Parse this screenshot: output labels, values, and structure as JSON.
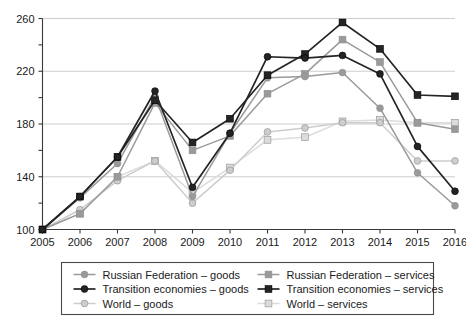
{
  "chart_data": {
    "type": "line",
    "title": "",
    "subtitle": "",
    "xlabel": "",
    "ylabel": "",
    "x": [
      2005,
      2006,
      2007,
      2008,
      2009,
      2010,
      2011,
      2012,
      2013,
      2014,
      2015,
      2016
    ],
    "categories": [
      "2005",
      "2006",
      "2007",
      "2008",
      "2009",
      "2010",
      "2011",
      "2012",
      "2013",
      "2014",
      "2015",
      "2016"
    ],
    "xlim": [
      2005,
      2016
    ],
    "ylim": [
      100,
      260
    ],
    "y_ticks_labeled": [
      100,
      140,
      180,
      220,
      260
    ],
    "y_ticks_minor": [
      120,
      160,
      200,
      240
    ],
    "grid": "horizontal",
    "legend_position": "bottom",
    "series": [
      {
        "name": "Russian Federation – goods",
        "key": "rf_goods",
        "color": "#9a9a9a",
        "marker": "circle",
        "values": [
          100,
          124,
          150,
          201,
          125,
          173,
          215,
          216,
          219,
          192,
          143,
          118
        ]
      },
      {
        "name": "Russian Federation – services",
        "key": "rf_services",
        "color": "#9a9a9a",
        "marker": "square",
        "values": [
          100,
          112,
          140,
          196,
          160,
          171,
          203,
          218,
          244,
          227,
          181,
          176
        ]
      },
      {
        "name": "Transition economies – goods",
        "key": "te_goods",
        "color": "#242424",
        "marker": "circle",
        "values": [
          100,
          125,
          155,
          205,
          132,
          173,
          231,
          230,
          232,
          218,
          163,
          129
        ]
      },
      {
        "name": "Transition economies – services",
        "key": "te_services",
        "color": "#242424",
        "marker": "square",
        "values": [
          100,
          125,
          155,
          198,
          166,
          184,
          217,
          233,
          257,
          237,
          202,
          201
        ]
      },
      {
        "name": "World – goods",
        "key": "world_goods",
        "color": "#cdcdcd",
        "marker": "circle",
        "values": [
          100,
          115,
          137,
          152,
          120,
          145,
          174,
          177,
          181,
          181,
          152,
          152
        ]
      },
      {
        "name": "World – services",
        "key": "world_services",
        "color": "#dcdcdc",
        "marker": "square",
        "values": [
          100,
          112,
          140,
          152,
          128,
          147,
          168,
          170,
          182,
          183,
          181,
          181
        ]
      }
    ]
  },
  "legend": {
    "entries": [
      {
        "label": "Russian Federation – goods",
        "series": "rf_goods"
      },
      {
        "label": "Russian Federation – services",
        "series": "rf_services"
      },
      {
        "label": "Transition economies – goods",
        "series": "te_goods"
      },
      {
        "label": "Transition economies – services",
        "series": "te_services"
      },
      {
        "label": "World – goods",
        "series": "world_goods"
      },
      {
        "label": "World – services",
        "series": "world_services"
      }
    ]
  }
}
